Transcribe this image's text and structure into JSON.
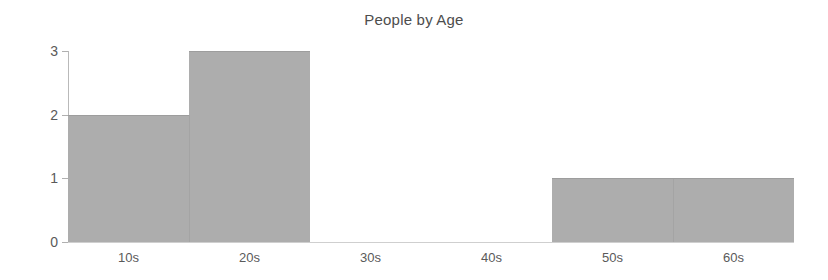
{
  "chart_data": {
    "type": "bar",
    "title": "People by Age",
    "xlabel": "",
    "ylabel": "",
    "categories": [
      "10s",
      "20s",
      "30s",
      "40s",
      "50s",
      "60s"
    ],
    "values": [
      2,
      3,
      0,
      0,
      1,
      1
    ],
    "ylim": [
      0,
      3
    ],
    "yticks": [
      0,
      1,
      2,
      3
    ],
    "ytick_labels": [
      "0",
      "1",
      "2",
      "3"
    ],
    "xtick_labels": [
      "10s",
      "20s",
      "30s",
      "40s",
      "50s",
      "60s"
    ],
    "grid": false,
    "legend": null,
    "bar_color": "#adadad",
    "axis_color": "#b9b9b9",
    "text_color": "#5a5a5a",
    "background": "#ffffff",
    "style": "histogram-contiguous-bars"
  },
  "chart": {
    "title": "People by Age",
    "y_ticks": [
      {
        "label": "3",
        "value": 3
      },
      {
        "label": "2",
        "value": 2
      },
      {
        "label": "1",
        "value": 1
      },
      {
        "label": "0",
        "value": 0
      }
    ],
    "x_ticks": [
      {
        "label": "10s",
        "value": 2
      },
      {
        "label": "20s",
        "value": 3
      },
      {
        "label": "30s",
        "value": 0
      },
      {
        "label": "40s",
        "value": 0
      },
      {
        "label": "50s",
        "value": 1
      },
      {
        "label": "60s",
        "value": 1
      }
    ]
  }
}
